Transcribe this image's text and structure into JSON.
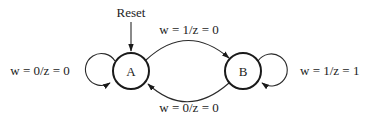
{
  "diagram": {
    "type": "finite-state-machine",
    "initial_marker": {
      "label": "Reset",
      "target": "A"
    },
    "states": [
      {
        "id": "A",
        "label": "A"
      },
      {
        "id": "B",
        "label": "B"
      }
    ],
    "transitions": [
      {
        "from": "A",
        "to": "A",
        "label_input": "w = 0",
        "label_output": "z = 0",
        "label": "w = 0/z = 0"
      },
      {
        "from": "A",
        "to": "B",
        "label": "w = 1/z = 0"
      },
      {
        "from": "B",
        "to": "A",
        "label": "w = 0/z = 0"
      },
      {
        "from": "B",
        "to": "B",
        "label": "w = 1/z = 1"
      }
    ]
  }
}
